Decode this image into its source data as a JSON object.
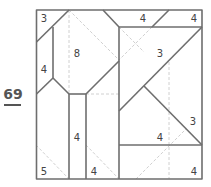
{
  "puzzle": {
    "number": "69",
    "colors": {
      "line": "#6e6e6e",
      "dashed": "#c4c4c4",
      "text": "#444444"
    },
    "clues": [
      {
        "value": "3",
        "x": 44,
        "y": 22
      },
      {
        "value": "4",
        "x": 142,
        "y": 22
      },
      {
        "value": "4",
        "x": 193,
        "y": 22
      },
      {
        "value": "8",
        "x": 77,
        "y": 57
      },
      {
        "value": "3",
        "x": 159,
        "y": 56
      },
      {
        "value": "4",
        "x": 43,
        "y": 73
      },
      {
        "value": "3",
        "x": 192,
        "y": 125
      },
      {
        "value": "4",
        "x": 77,
        "y": 141
      },
      {
        "value": "4",
        "x": 159,
        "y": 141
      },
      {
        "value": "5",
        "x": 43,
        "y": 175
      },
      {
        "value": "4",
        "x": 93,
        "y": 175
      },
      {
        "value": "4",
        "x": 193,
        "y": 175
      }
    ]
  }
}
